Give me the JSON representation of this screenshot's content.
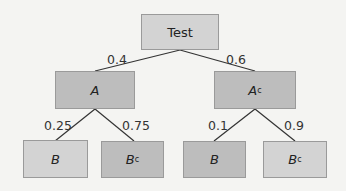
{
  "tree": {
    "root": {
      "label": "Test"
    },
    "level1": [
      {
        "label": "A",
        "sup": "",
        "prob": "0.4"
      },
      {
        "label": "A",
        "sup": "c",
        "prob": "0.6"
      }
    ],
    "level2": [
      {
        "label": "B",
        "sup": "",
        "prob": "0.25"
      },
      {
        "label": "B",
        "sup": "c",
        "prob": "0.75"
      },
      {
        "label": "B",
        "sup": "",
        "prob": "0.1"
      },
      {
        "label": "B",
        "sup": "c",
        "prob": "0.9"
      }
    ]
  },
  "colors": {
    "light_box": "#d3d3d3",
    "dark_box": "#bdbdbd",
    "line": "#333333",
    "background": "#f4f4f2"
  }
}
